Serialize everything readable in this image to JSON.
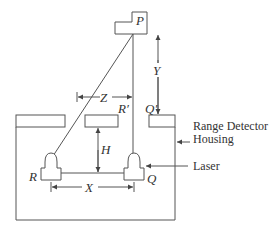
{
  "diagram": {
    "labels": {
      "P": "P",
      "Y": "Y",
      "Z": "Z",
      "R_prime": "R′",
      "Q_prime": "Q′",
      "H": "H",
      "R": "R",
      "Q": "Q",
      "X": "X"
    },
    "annotations": {
      "housing_line1": "Range Detector",
      "housing_line2": "Housing",
      "laser": "Laser"
    },
    "colors": {
      "stroke": "#555555",
      "text": "#333333",
      "background": "#ffffff"
    }
  }
}
